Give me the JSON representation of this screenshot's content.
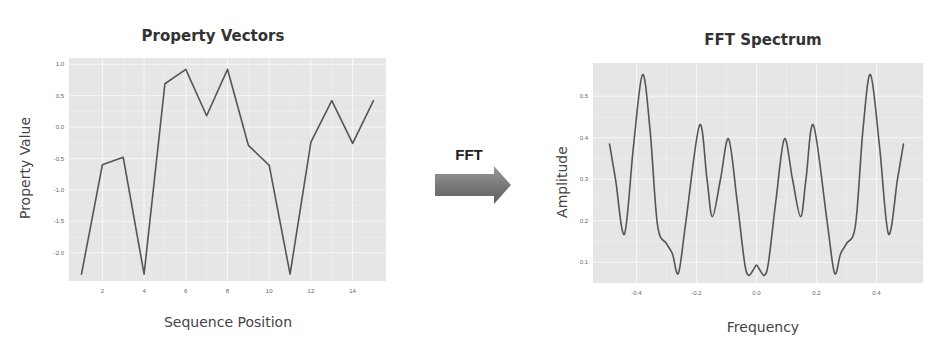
{
  "chart_data": [
    {
      "type": "line",
      "title": "Property Vectors",
      "xlabel": "Sequence Position",
      "ylabel": "Property Value",
      "x": [
        1,
        2,
        3,
        4,
        5,
        6,
        7,
        8,
        9,
        10,
        11,
        12,
        13,
        14,
        15
      ],
      "values": [
        -2.34,
        -0.6,
        -0.48,
        -2.34,
        0.69,
        0.92,
        0.18,
        0.92,
        -0.29,
        -0.61,
        -2.34,
        -0.24,
        0.42,
        -0.26,
        0.42
      ],
      "xticks": [
        2,
        4,
        6,
        8,
        10,
        12,
        14
      ],
      "xtick_labels": [
        "2",
        "4",
        "6",
        "8",
        "10",
        "12",
        "14"
      ],
      "yticks": [
        1.0,
        0.5,
        0.0,
        -0.5,
        -1.0,
        -1.5,
        -2.0
      ],
      "ytick_labels": [
        "1.0",
        "0.5",
        "0.0",
        "-0.5",
        "-1.0",
        "-1.5",
        "-2.0"
      ],
      "xlim": [
        0.4,
        15.6
      ],
      "ylim": [
        -2.45,
        1.1
      ],
      "grid": true,
      "series_color": "#555555",
      "panel_color": "#e6e6e6"
    },
    {
      "type": "line",
      "title": "FFT Spectrum",
      "xlabel": "Frequency",
      "ylabel": "Amplitude",
      "x": [
        -0.49,
        -0.47,
        -0.44,
        -0.41,
        -0.38,
        -0.355,
        -0.33,
        -0.3,
        -0.28,
        -0.26,
        -0.235,
        -0.19,
        -0.165,
        -0.147,
        -0.12,
        -0.093,
        -0.065,
        -0.04,
        -0.027,
        -0.012,
        0.0,
        0.012,
        0.027,
        0.04,
        0.065,
        0.093,
        0.12,
        0.147,
        0.165,
        0.19,
        0.235,
        0.26,
        0.28,
        0.3,
        0.33,
        0.355,
        0.38,
        0.41,
        0.44,
        0.47,
        0.49
      ],
      "values": [
        0.385,
        0.3,
        0.168,
        0.38,
        0.552,
        0.42,
        0.19,
        0.145,
        0.12,
        0.074,
        0.2,
        0.43,
        0.3,
        0.21,
        0.3,
        0.397,
        0.25,
        0.1,
        0.069,
        0.08,
        0.093,
        0.08,
        0.069,
        0.1,
        0.25,
        0.397,
        0.3,
        0.21,
        0.3,
        0.43,
        0.2,
        0.074,
        0.12,
        0.145,
        0.19,
        0.42,
        0.552,
        0.38,
        0.168,
        0.3,
        0.385
      ],
      "xticks": [
        -0.4,
        -0.2,
        0.0,
        0.2,
        0.4
      ],
      "xtick_labels": [
        "-0.4",
        "-0.2",
        "0.0",
        "0.2",
        "0.4"
      ],
      "yticks": [
        0.5,
        0.4,
        0.3,
        0.2,
        0.1
      ],
      "ytick_labels": [
        "0.5",
        "0.4",
        "0.3",
        "0.2",
        "0.1"
      ],
      "xlim": [
        -0.545,
        0.555
      ],
      "ylim": [
        0.05,
        0.58
      ],
      "grid": true,
      "series_color": "#555555",
      "panel_color": "#e6e6e6"
    }
  ],
  "arrow": {
    "label": "FFT",
    "icon": "right-arrow-icon",
    "color": "#7a7a7a"
  }
}
